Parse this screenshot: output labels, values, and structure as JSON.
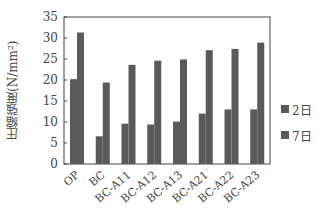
{
  "chart_data": {
    "type": "bar",
    "title": "",
    "xlabel": "",
    "ylabel": "圧縮強度(N/mm²)",
    "ylim": [
      0,
      35
    ],
    "yticks": [
      0,
      5,
      10,
      15,
      20,
      25,
      30,
      35
    ],
    "grid": false,
    "legend_position": "right",
    "categories": [
      "OP",
      "BC",
      "BC-A11",
      "BC-A12",
      "BC-A13",
      "BC-A21",
      "BC-A22",
      "BC-A23"
    ],
    "series": [
      {
        "name": "2日",
        "color": "#5a5a5a",
        "values": [
          20.2,
          6.6,
          9.6,
          9.4,
          10.1,
          12.0,
          13.0,
          13.0
        ]
      },
      {
        "name": "7日",
        "color": "#5a5a5a",
        "values": [
          31.3,
          19.4,
          23.6,
          24.6,
          24.9,
          27.1,
          27.4,
          28.9
        ]
      }
    ]
  }
}
